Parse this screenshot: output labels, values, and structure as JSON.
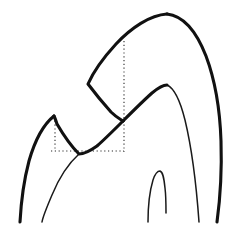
{
  "figure": {
    "background_color": "#ffffff",
    "canvas": {
      "width": 242,
      "height": 225
    },
    "stroke_colors": {
      "outline": "#111111",
      "inner": "#1a1a1a",
      "guide": "#2b2b2b"
    },
    "stroke_widths": {
      "outline": 3.1,
      "inner": 1.5,
      "guide": 1.1
    },
    "guide_dash_pattern": "1.2 2.6"
  },
  "chart_data": {
    "type": "line",
    "subtitle": "",
    "xlabel": "",
    "ylabel": "",
    "xlim": [
      0,
      242
    ],
    "ylim": [
      0,
      225
    ],
    "grid": false,
    "legend": "none",
    "annotations": [],
    "series": [
      {
        "name": "main-crown-outline",
        "role": "thick-contour",
        "stroke": "#111111",
        "width": 3.1,
        "path": "M 167 14 C 150 15 131 28 116 44 C 105 56 95 68 88 84 C 94 92 103 103 111 112 C 116 117 120 119 123 121",
        "points": [
          [
            167,
            14
          ],
          [
            148,
            19
          ],
          [
            128,
            32
          ],
          [
            110,
            52
          ],
          [
            96,
            71
          ],
          [
            88,
            84
          ],
          [
            99,
            99
          ],
          [
            112,
            113
          ],
          [
            123,
            121
          ]
        ]
      },
      {
        "name": "crown-right-outer-limb",
        "role": "thick-contour",
        "stroke": "#111111",
        "width": 3.1,
        "path": "M 167 14 C 185 16 197 33 206 56 C 215 80 220 110 221 141 C 222 172 220 200 217 222",
        "points": [
          [
            167,
            14
          ],
          [
            186,
            20
          ],
          [
            200,
            42
          ],
          [
            211,
            72
          ],
          [
            219,
            110
          ],
          [
            221,
            150
          ],
          [
            219,
            190
          ],
          [
            217,
            222
          ]
        ]
      },
      {
        "name": "second-cusp-outline",
        "role": "thick-contour",
        "stroke": "#111111",
        "width": 3.1,
        "path": "M 123 121 C 132 112 143 101 152 93 C 158 88 163 85 167 85",
        "points": [
          [
            123,
            121
          ],
          [
            136,
            108
          ],
          [
            148,
            96
          ],
          [
            160,
            87
          ],
          [
            167,
            85
          ]
        ]
      },
      {
        "name": "first-cusp-left-outline",
        "role": "thick-contour",
        "stroke": "#111111",
        "width": 3.1,
        "path": "M 123 121 C 114 130 105 139 97 146 C 90 151 84 154 79 154 C 72 147 64 136 57 124 C 56 121 55 118 54 116",
        "points": [
          [
            123,
            121
          ],
          [
            110,
            135
          ],
          [
            97,
            146
          ],
          [
            86,
            153
          ],
          [
            79,
            154
          ],
          [
            68,
            141
          ],
          [
            58,
            126
          ],
          [
            54,
            116
          ]
        ]
      },
      {
        "name": "left-cusp-outer-limb",
        "role": "thick-contour",
        "stroke": "#111111",
        "width": 3.1,
        "path": "M 54 116 C 44 124 35 140 29 161 C 24 180 21 203 20 222",
        "points": [
          [
            54,
            116
          ],
          [
            44,
            126
          ],
          [
            34,
            145
          ],
          [
            27,
            170
          ],
          [
            21,
            198
          ],
          [
            20,
            222
          ]
        ]
      },
      {
        "name": "left-inner-root-curve",
        "role": "thin-contour",
        "stroke": "#1a1a1a",
        "width": 1.5,
        "path": "M 79 154 C 69 163 59 178 52 195 C 46 209 43 216 42 222",
        "points": [
          [
            79,
            154
          ],
          [
            69,
            163
          ],
          [
            58,
            180
          ],
          [
            49,
            200
          ],
          [
            42,
            222
          ]
        ]
      },
      {
        "name": "right-inner-crown-curve",
        "role": "thin-contour",
        "stroke": "#1a1a1a",
        "width": 1.5,
        "path": "M 167 85 C 174 88 180 100 185 120 C 191 145 196 180 199 222",
        "points": [
          [
            167,
            85
          ],
          [
            176,
            92
          ],
          [
            184,
            116
          ],
          [
            191,
            150
          ],
          [
            196,
            190
          ],
          [
            199,
            222
          ]
        ]
      },
      {
        "name": "central-notch-curve",
        "role": "thin-contour",
        "stroke": "#1a1a1a",
        "width": 1.5,
        "path": "M 148 222 C 148 205 150 190 153 180 C 155 174 158 171 160 171 C 163 172 164 178 165 188 C 166 196 166 206 166 213",
        "points": [
          [
            148,
            222
          ],
          [
            149,
            202
          ],
          [
            153,
            181
          ],
          [
            160,
            171
          ],
          [
            164,
            184
          ],
          [
            166,
            205
          ],
          [
            166,
            213
          ]
        ]
      },
      {
        "name": "guide-vertical-right",
        "role": "dotted-guide",
        "stroke": "#2b2b2b",
        "width": 1.1,
        "path": "M 124 41 L 124 152",
        "points": [
          [
            124,
            41
          ],
          [
            124,
            152
          ]
        ]
      },
      {
        "name": "guide-vertical-left",
        "role": "dotted-guide",
        "stroke": "#2b2b2b",
        "width": 1.1,
        "path": "M 55 117 L 55 151",
        "points": [
          [
            55,
            117
          ],
          [
            55,
            151
          ]
        ]
      },
      {
        "name": "guide-horizontal-base",
        "role": "dotted-guide",
        "stroke": "#2b2b2b",
        "width": 1.1,
        "path": "M 51 151 L 124 151",
        "points": [
          [
            51,
            151
          ],
          [
            124,
            151
          ]
        ]
      }
    ]
  }
}
